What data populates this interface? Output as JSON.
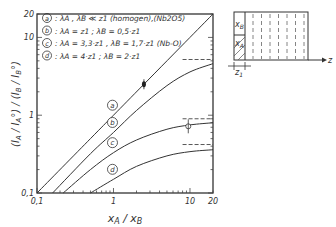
{
  "chart_data": {
    "type": "line",
    "title": "",
    "xlabel": "x_A / x_B",
    "ylabel": "(I_A / I_A°) / (I_B / I_B°)",
    "xscale": "log",
    "yscale": "log",
    "xlim": [
      0.1,
      20
    ],
    "ylim": [
      0.1,
      20
    ],
    "x_ticks": [
      "0,1",
      "1",
      "10",
      "20"
    ],
    "y_ticks": [
      "0,1",
      "1",
      "10",
      "20"
    ],
    "grid": false,
    "legend": [
      {
        "key": "a",
        "text": "λA , λB ≪ z1  (homogen),(Nb2O5)"
      },
      {
        "key": "b",
        "text": "λA = z1 ; λB = 0,5·z1"
      },
      {
        "key": "c",
        "text": "λA = 3,3·z1 , λB = 1,7·z1 (Nb-O)"
      },
      {
        "key": "d",
        "text": "λA = 4·z1 ; λB = 2·z1"
      }
    ],
    "series": [
      {
        "name": "a",
        "x": [
          0.1,
          0.5,
          1,
          2.5,
          10,
          20
        ],
        "y": [
          0.1,
          0.5,
          1,
          2.5,
          10,
          20
        ]
      },
      {
        "name": "b",
        "x": [
          0.16,
          0.5,
          1,
          2,
          5,
          10,
          20
        ],
        "y": [
          0.1,
          0.32,
          0.6,
          1.15,
          2.4,
          3.6,
          4.6
        ]
      },
      {
        "name": "c",
        "x": [
          0.22,
          0.5,
          1,
          2,
          5,
          10,
          20
        ],
        "y": [
          0.1,
          0.2,
          0.33,
          0.48,
          0.66,
          0.75,
          0.8
        ]
      },
      {
        "name": "d",
        "x": [
          0.5,
          1,
          2,
          5,
          10,
          20
        ],
        "y": [
          0.1,
          0.15,
          0.22,
          0.3,
          0.34,
          0.36
        ]
      }
    ],
    "asymptotes": [
      {
        "series": "b",
        "y": 5.2
      },
      {
        "series": "c",
        "y": 0.9
      },
      {
        "series": "d",
        "y": 0.42
      }
    ],
    "data_points": [
      {
        "x": 2.5,
        "y": 2.5,
        "marker": "filled"
      },
      {
        "x": 9.5,
        "y": 0.72,
        "marker": "open"
      }
    ]
  },
  "inset": {
    "label_top": "x_B",
    "label_bottom": "x_A",
    "axis_label": "z",
    "thickness_label": "z1"
  }
}
